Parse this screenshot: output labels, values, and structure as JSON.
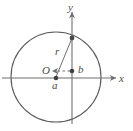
{
  "figure": {
    "background_color": "#ffffff",
    "stroke_color": "#5a5a5a",
    "axis_color": "#6e6e6e",
    "label_color": "#4a4a4a",
    "labels": {
      "y_axis": "y",
      "x_axis": "x",
      "radius": "r",
      "origin": "O",
      "point_b": "b",
      "point_a": "a"
    },
    "geometry": {
      "circle_center_x": 56,
      "circle_center_y": 77,
      "circle_radius": 45,
      "x_axis_y": 78,
      "y_axis_x": 72,
      "point_a_x": 56,
      "point_a_y": 78,
      "point_b_x": 72,
      "point_b_y": 71,
      "radius_endpoint_x": 72,
      "radius_endpoint_y": 38
    }
  }
}
